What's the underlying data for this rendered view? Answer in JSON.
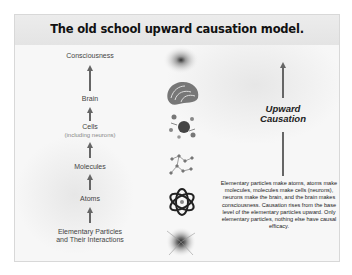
{
  "slide": {
    "title": "The old school upward causation model.",
    "levels": [
      {
        "label": "Consciousness",
        "sublabel": ""
      },
      {
        "label": "Brain",
        "sublabel": ""
      },
      {
        "label": "Cells",
        "sublabel": "(including neurons)"
      },
      {
        "label": "Molecules",
        "sublabel": ""
      },
      {
        "label": "Atoms",
        "sublabel": ""
      },
      {
        "label": "Elementary Particles",
        "sublabel": "and Their Interactions"
      }
    ],
    "images": [
      {
        "name": "consciousness-glow-image"
      },
      {
        "name": "brain-image"
      },
      {
        "name": "cells-image"
      },
      {
        "name": "molecule-image"
      },
      {
        "name": "atom-image"
      },
      {
        "name": "particle-burst-image"
      }
    ],
    "side_label": {
      "line1": "Upward",
      "line2": "Causation"
    },
    "description": "Elementary particles make atoms, atoms make molecules, molecules make cells (neurons), neurons make the brain, and the brain makes consciousness. Causation rises from the base level of the elementary particles upward. Only elementary particles, nothing else have causal efficacy.",
    "colors": {
      "arrow": "#666666",
      "title_bar": "#e8e8e8",
      "background": "#f7f7f7"
    }
  }
}
